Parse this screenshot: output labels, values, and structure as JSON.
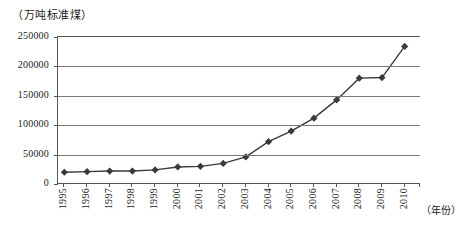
{
  "chart_data": {
    "type": "line",
    "title": "",
    "unit_label": "（万吨标准煤）",
    "xlabel": "（年份）",
    "ylabel": "",
    "categories": [
      "1995",
      "1996",
      "1997",
      "1998",
      "1999",
      "2000",
      "2001",
      "2002",
      "2003",
      "2004",
      "2005",
      "2006",
      "2007",
      "2008",
      "2009",
      "2010"
    ],
    "values": [
      20000,
      21000,
      22000,
      22000,
      24000,
      29000,
      30000,
      35000,
      46000,
      72000,
      90000,
      112000,
      143000,
      180000,
      181000,
      234000
    ],
    "ylim": [
      0,
      250000
    ],
    "yticks": [
      0,
      50000,
      100000,
      150000,
      200000,
      250000
    ],
    "ytick_labels": [
      "0",
      "50000",
      "100000",
      "150000",
      "200000",
      "250000"
    ],
    "grid": true,
    "legend": "none",
    "marker": "diamond",
    "series_color": "#3a3a3a",
    "grid_color": "#77787c",
    "axis_color": "#55565a"
  }
}
